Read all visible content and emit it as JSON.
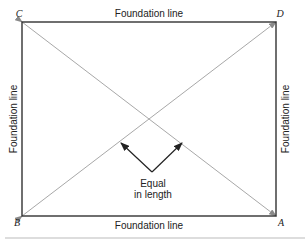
{
  "diagram": {
    "type": "foundation-layout-diagonal-check",
    "corners": {
      "top_left": "C",
      "top_right": "D",
      "bottom_left": "B",
      "bottom_right": "A"
    },
    "sides": {
      "top": "Foundation line",
      "bottom": "Foundation line",
      "left": "Foundation line",
      "right": "Foundation line"
    },
    "annotation": {
      "line1": "Equal",
      "line2": "in length"
    },
    "colors": {
      "frame": "#333333",
      "diagonal": "#a8a8a8",
      "arrow": "#222222",
      "rule": "#bbbbbb"
    }
  }
}
